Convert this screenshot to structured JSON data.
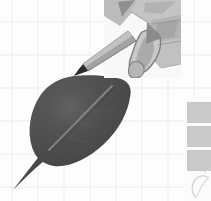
{
  "figure": {
    "title": "Leaf with hand-held stylus",
    "subject": "leaf",
    "background_label": "graph-paper grid"
  },
  "canvas": {
    "width": 211,
    "height": 201,
    "background_color": "#fdfdfd"
  },
  "grid": {
    "label": "graph paper grid",
    "line_color": "#f0f0f0",
    "line_color_strong": "#e8e8e8",
    "vertical_positions": [
      12,
      38,
      64,
      90,
      116,
      142,
      168,
      194
    ],
    "horizontal_positions": [
      22,
      55,
      88,
      121,
      154,
      187
    ],
    "line_width": 1.2
  },
  "leaf": {
    "label": "dark ovate leaf",
    "fill_color": "#4f4f50",
    "fill_color_light": "#646466",
    "fill_color_dark": "#3c3c3e",
    "edge_color": "#343436",
    "midrib_color": "#8a8a8c",
    "midrib_label": "midrib vein",
    "petiole_label": "petiole",
    "apex_x": 132,
    "apex_y": 78,
    "base_x": 14,
    "base_y": 188
  },
  "hand": {
    "label": "hand holding stylus",
    "panel_color": "#f7f7f7",
    "skin_color": "#b9b9ba",
    "skin_shadow": "#9a9a9c",
    "skin_light": "#cccccd",
    "skin_dark": "#858587",
    "outline_color": "#6f6f71",
    "panel_x": 104,
    "panel_y": 0,
    "panel_width": 77,
    "panel_height": 78
  },
  "stylus": {
    "label": "stylus needle",
    "body_color": "#9d9d9f",
    "body_shadow": "#757577",
    "tip_color": "#2a2a2c",
    "tip_x": 74,
    "tip_y": 75,
    "base_x": 128,
    "base_y": 36
  },
  "right_panel": {
    "label": "adjacent panel fragment",
    "block_color": "#c9c9ca",
    "divider_color": "#fdfdfd",
    "outline_color": "#d8d8d9",
    "x": 186,
    "y": 102,
    "width": 25,
    "blocks": [
      {
        "y": 102,
        "height": 21
      },
      {
        "y": 126,
        "height": 21
      },
      {
        "y": 150,
        "height": 21
      }
    ],
    "sketch_label": "partial leaf sketch outline"
  }
}
